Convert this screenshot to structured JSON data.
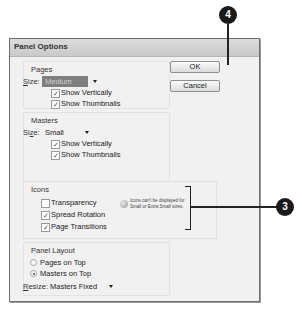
{
  "dialog": {
    "title": "Panel Options",
    "buttons": {
      "ok": "OK",
      "cancel": "Cancel"
    }
  },
  "pages": {
    "label": "Pages",
    "size_label_underlined": "S",
    "size_label_rest": "ize:",
    "size_value": "Medium",
    "show_vertically": {
      "label": "Show Vertically",
      "checked": true
    },
    "show_thumbnails": {
      "label": "Show Thumbnails",
      "checked": true
    }
  },
  "masters": {
    "label": "Masters",
    "size_label_pre": "Si",
    "size_label_underlined": "z",
    "size_label_rest": "e:",
    "size_value": "Small",
    "show_vertically": {
      "label": "Show Vertically",
      "checked": true
    },
    "show_thumbnails": {
      "label": "Show Thumbnails",
      "checked": true
    }
  },
  "icons": {
    "label": "Icons",
    "transparency": {
      "label": "Transparency",
      "checked": false
    },
    "spread_rotation": {
      "label": "Spread Rotation",
      "checked": true
    },
    "page_transitions": {
      "label": "Page Transitions",
      "checked": true
    },
    "info_line1": "Icons can't be displayed for",
    "info_line2": "Small or Extra Small sizes."
  },
  "panel_layout": {
    "label": "Panel Layout",
    "pages_on_top": {
      "label": "Pages on Top",
      "selected": false
    },
    "masters_on_top": {
      "label": "Masters on Top",
      "selected": true
    },
    "resize_label_underlined": "R",
    "resize_label_rest": "esize:",
    "resize_value": "Masters Fixed"
  },
  "callouts": {
    "ok": "4",
    "icons": "3"
  },
  "check_glyph": "✓"
}
